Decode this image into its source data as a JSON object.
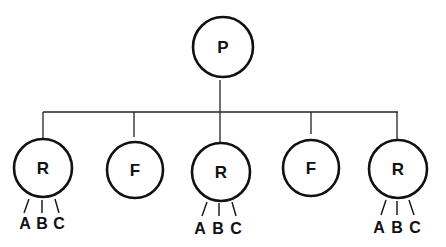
{
  "diagram": {
    "type": "tree",
    "root": {
      "label": "P",
      "cx": 223,
      "cy": 47,
      "r": 30
    },
    "bus": {
      "y": 112,
      "x_start": 43,
      "x_end": 398
    },
    "children": [
      {
        "label": "R",
        "cx": 43,
        "cy": 168,
        "r": 29,
        "drop_x": 43,
        "leaves": [
          {
            "label": "A",
            "x": 25,
            "y": 223,
            "line": [
              29,
              199,
              24,
              213
            ]
          },
          {
            "label": "B",
            "x": 42,
            "y": 223,
            "line": [
              42,
              200,
              42,
              213
            ]
          },
          {
            "label": "C",
            "x": 59,
            "y": 223,
            "line": [
              55,
              199,
              59,
              213
            ]
          }
        ]
      },
      {
        "label": "F",
        "cx": 135,
        "cy": 170,
        "r": 28,
        "drop_x": 134,
        "drop_end": 137,
        "leaves": []
      },
      {
        "label": "R",
        "cx": 221,
        "cy": 172,
        "r": 29,
        "drop_x": 220,
        "leaves": [
          {
            "label": "A",
            "x": 200,
            "y": 228,
            "line": [
              207,
              202,
              202,
              216
            ]
          },
          {
            "label": "B",
            "x": 218,
            "y": 228,
            "line": [
              219,
              203,
              219,
              216
            ]
          },
          {
            "label": "C",
            "x": 236,
            "y": 228,
            "line": [
              232,
              202,
              236,
              216
            ]
          }
        ]
      },
      {
        "label": "F",
        "cx": 311,
        "cy": 168,
        "r": 28,
        "drop_x": 311,
        "drop_end": 134,
        "leaves": []
      },
      {
        "label": "R",
        "cx": 398,
        "cy": 169,
        "r": 29,
        "drop_x": 397,
        "leaves": [
          {
            "label": "A",
            "x": 379,
            "y": 227,
            "line": [
              386,
              200,
              381,
              215
            ]
          },
          {
            "label": "B",
            "x": 397,
            "y": 227,
            "line": [
              397,
              201,
              397,
              215
            ]
          },
          {
            "label": "C",
            "x": 415,
            "y": 227,
            "line": [
              409,
              200,
              414,
              215
            ]
          }
        ]
      }
    ]
  },
  "colors": {
    "stroke": "#111111",
    "background": "#ffffff"
  }
}
